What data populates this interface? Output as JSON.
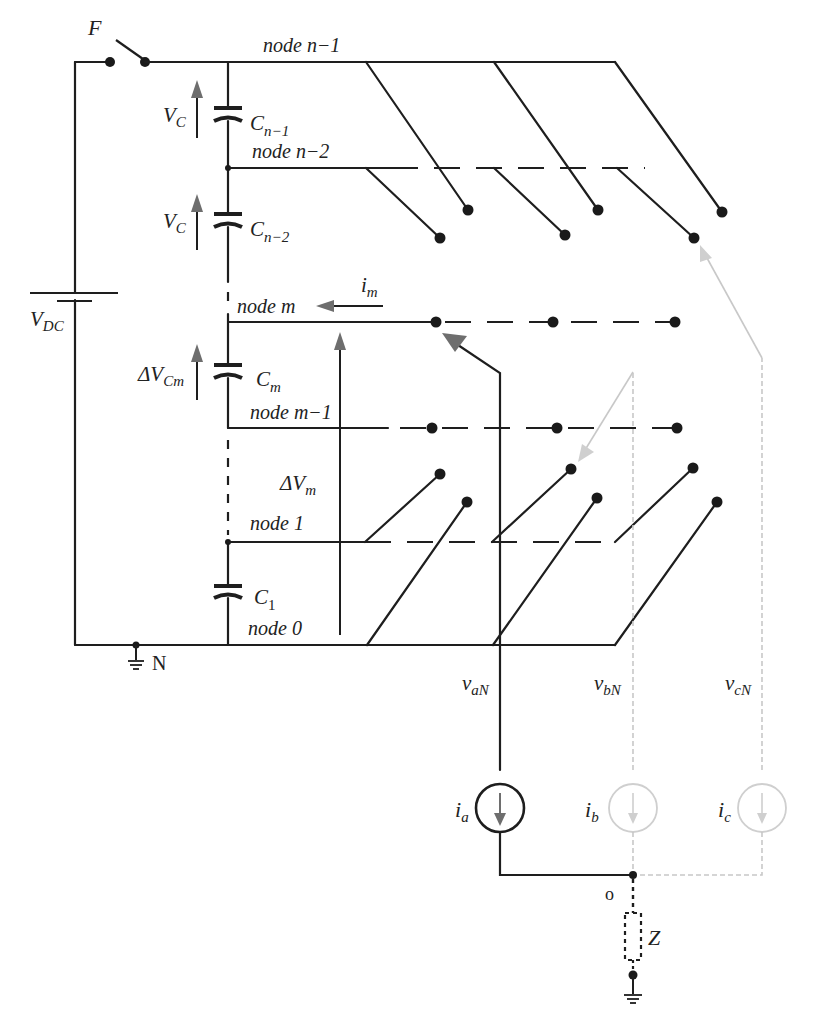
{
  "diagram": {
    "type": "multilevel-inverter-circuit",
    "colors": {
      "wire": "#1e1e1e",
      "arrow_dark": "#6e6e6e",
      "inactive_phase": "#c8c8c8",
      "background": "#ffffff"
    },
    "labels": {
      "switch": "F",
      "dc_source": "V",
      "dc_source_sub": "DC",
      "ground_n": "N",
      "node_o": "o",
      "impedance": "Z",
      "current_m": "i",
      "current_m_sub": "m",
      "delta_vm": "ΔV",
      "delta_vm_sub": "m"
    },
    "nodes": [
      {
        "id": "n-1",
        "text": "node n−1"
      },
      {
        "id": "n-2",
        "text": "node n−2"
      },
      {
        "id": "m",
        "text": "node m"
      },
      {
        "id": "m-1",
        "text": "node m−1"
      },
      {
        "id": "1",
        "text": "node 1"
      },
      {
        "id": "0",
        "text": "node 0"
      }
    ],
    "capacitors": [
      {
        "name": "C",
        "sub": "n−1",
        "voltage": "V",
        "voltage_sub": "C"
      },
      {
        "name": "C",
        "sub": "n−2",
        "voltage": "V",
        "voltage_sub": "C"
      },
      {
        "name": "C",
        "sub": "m",
        "voltage": "ΔV",
        "voltage_sub": "Cm"
      },
      {
        "name": "C",
        "sub": "1"
      }
    ],
    "phases": [
      {
        "voltage": "v",
        "voltage_sub": "aN",
        "current": "i",
        "current_sub": "a",
        "active": true
      },
      {
        "voltage": "v",
        "voltage_sub": "bN",
        "current": "i",
        "current_sub": "b",
        "active": false
      },
      {
        "voltage": "v",
        "voltage_sub": "cN",
        "current": "i",
        "current_sub": "c",
        "active": false
      }
    ]
  }
}
